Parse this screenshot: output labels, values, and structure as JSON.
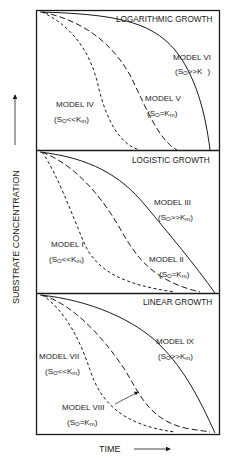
{
  "figure": {
    "y_axis_label": "SUBSTRATE CONCENTRATION",
    "x_axis_label": "TIME",
    "panels": [
      {
        "title": "LOGARITHMIC GROWTH",
        "models": [
          {
            "name": "MODEL IV",
            "condition": "(S₀<<Kₘ)",
            "cond_a": "(S",
            "cond_sub": "O",
            "cond_b": "<<K",
            "cond_sub2": "m",
            "cond_c": ")",
            "line": "short-dash"
          },
          {
            "name": "MODEL V",
            "condition": "(S₀=Kₘ)",
            "cond_a": "(S",
            "cond_sub": "O",
            "cond_b": "=K",
            "cond_sub2": "m",
            "cond_c": ")",
            "line": "long-dash"
          },
          {
            "name": "MODEL VI",
            "condition": "(S₀>>K )",
            "cond_a": "(S",
            "cond_sub": "O",
            "cond_b": ">>K",
            "cond_sub2": " ",
            "cond_c": ")",
            "line": "solid"
          }
        ]
      },
      {
        "title": "LOGISTIC GROWTH",
        "models": [
          {
            "name": "MODEL I",
            "condition": "(S₀<<Kₘ)",
            "cond_a": "(S",
            "cond_sub": "O",
            "cond_b": "<<K",
            "cond_sub2": "m",
            "cond_c": ")",
            "line": "short-dash"
          },
          {
            "name": "MODEL II",
            "condition": "(S₀=Kₘ)",
            "cond_a": "(S",
            "cond_sub": "O",
            "cond_b": "=K",
            "cond_sub2": "m",
            "cond_c": ")",
            "line": "long-dash"
          },
          {
            "name": "MODEL III",
            "condition": "(S₀>>Kₘ)",
            "cond_a": "(S",
            "cond_sub": "O",
            "cond_b": ">>K",
            "cond_sub2": "m",
            "cond_c": ")",
            "line": "solid"
          }
        ]
      },
      {
        "title": "LINEAR GROWTH",
        "models": [
          {
            "name": "MODEL VII",
            "condition": "(S₀<<Kₘ)",
            "cond_a": "(S",
            "cond_sub": "O",
            "cond_b": "<<K",
            "cond_sub2": "m",
            "cond_c": ")",
            "line": "short-dash"
          },
          {
            "name": "MODEL VIII",
            "condition": "(S₀=Kₘ)",
            "cond_a": "(S",
            "cond_sub": "O",
            "cond_b": "=K",
            "cond_sub2": "m",
            "cond_c": ")",
            "line": "long-dash"
          },
          {
            "name": "MODEL IX",
            "condition": "(S₀>>Kₘ)",
            "cond_a": "(S",
            "cond_sub": "O",
            "cond_b": ">>K",
            "cond_sub2": "m",
            "cond_c": ")",
            "line": "solid"
          }
        ]
      }
    ],
    "colors": {
      "ink": "#1a1a1a",
      "background": "#ffffff"
    }
  }
}
